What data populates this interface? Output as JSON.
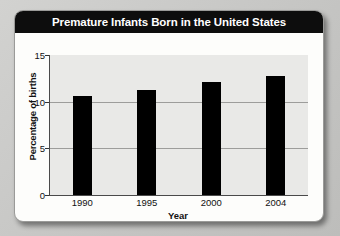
{
  "card": {
    "title": "Premature Infants Born in the United States"
  },
  "chart_data": {
    "type": "bar",
    "title": "Premature Infants Born in the United States",
    "categories": [
      "1990",
      "1995",
      "2000",
      "2004"
    ],
    "values": [
      10.6,
      11.3,
      12.1,
      12.8
    ],
    "series": [
      {
        "name": "Percentage of births",
        "values": [
          10.6,
          11.3,
          12.1,
          12.8
        ]
      }
    ],
    "xlabel": "Year",
    "ylabel": "Percentage of births",
    "ylim": [
      0,
      15
    ],
    "yticks": [
      0,
      5,
      10,
      15
    ],
    "ytick_labels": [
      "0",
      "5",
      "10",
      "15"
    ],
    "grid": true,
    "gridlines_at": [
      5,
      10
    ],
    "legend": false,
    "bar_color": "#000000",
    "plot_background": "#e9e9e7",
    "title_background": "#0d0d0d",
    "title_color": "#ffffff"
  }
}
